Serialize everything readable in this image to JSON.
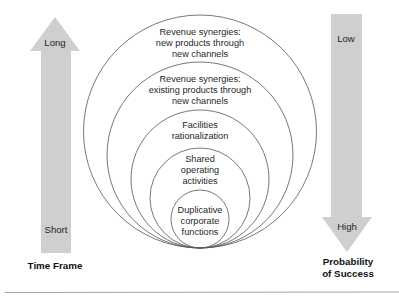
{
  "diagram": {
    "type": "nested-circles",
    "circles": [
      {
        "id": 1,
        "label_lines": [
          "Revenue synergies:",
          "new products through",
          "new channels"
        ]
      },
      {
        "id": 2,
        "label_lines": [
          "Revenue synergies:",
          "existing products through",
          "new channels"
        ]
      },
      {
        "id": 3,
        "label_lines": [
          "Facilities",
          "rationalization"
        ]
      },
      {
        "id": 4,
        "label_lines": [
          "Shared",
          "operating",
          "activities"
        ]
      },
      {
        "id": 5,
        "label_lines": [
          "Duplicative",
          "corporate",
          "functions"
        ]
      }
    ],
    "left_axis": {
      "direction": "up",
      "top_label": "Long",
      "bottom_label": "Short",
      "title": "Time Frame"
    },
    "right_axis": {
      "direction": "down",
      "top_label": "Low",
      "bottom_label": "High",
      "title_lines": [
        "Probability",
        "of Success"
      ]
    },
    "colors": {
      "arrow_fill": "#cfcfcf",
      "circle_stroke": "#555555",
      "rule": "#9a9a9a"
    }
  }
}
